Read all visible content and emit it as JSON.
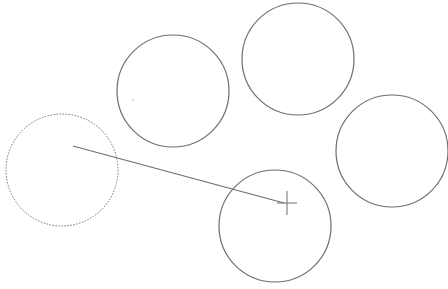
{
  "canvas": {
    "width": 448,
    "height": 289,
    "background": "#ffffff",
    "stroke_color": "#6e6e6e",
    "title": "Drawing canvas"
  },
  "circles": [
    {
      "id": "circle-1",
      "cx": 173,
      "cy": 91,
      "r": 56,
      "style": "solid"
    },
    {
      "id": "circle-2",
      "cx": 298,
      "cy": 59,
      "r": 56,
      "style": "solid"
    },
    {
      "id": "circle-3",
      "cx": 392,
      "cy": 151,
      "r": 56,
      "style": "solid"
    },
    {
      "id": "circle-4",
      "cx": 275,
      "cy": 226,
      "r": 56,
      "style": "solid"
    },
    {
      "id": "circle-dragging",
      "cx": 62,
      "cy": 170,
      "r": 56,
      "style": "dotted"
    }
  ],
  "drag_line": {
    "x1": 73,
    "y1": 146,
    "x2": 284,
    "y2": 203
  },
  "cursor": {
    "type": "crosshair",
    "x": 287,
    "y": 203,
    "half_width": 10,
    "half_height": 12
  },
  "stray_dot": {
    "x": 133,
    "y": 100
  }
}
